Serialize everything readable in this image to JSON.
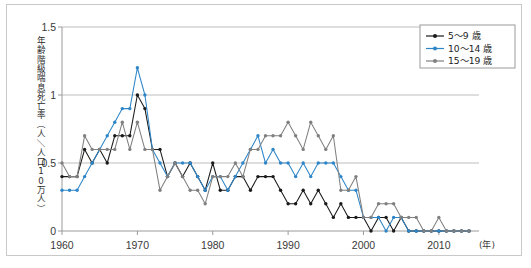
{
  "chart_data": {
    "type": "line",
    "title": "",
    "xlabel": "(年)",
    "ylabel": "年齢階級喘息死亡率（人／人口10万人）",
    "ylim": [
      0,
      1.5
    ],
    "xlim": [
      1960,
      2014
    ],
    "yticks": [
      "0",
      "0.5",
      "1",
      "1.5"
    ],
    "ytick_values": [
      0,
      0.5,
      1,
      1.5
    ],
    "xticks": [
      "1960",
      "1970",
      "1980",
      "1990",
      "2000",
      "2010"
    ],
    "xtick_values": [
      1960,
      1970,
      1980,
      1990,
      2000,
      2010
    ],
    "grid": "horizontal",
    "legend_position": "top-right",
    "x": [
      1960,
      1961,
      1962,
      1963,
      1964,
      1965,
      1966,
      1967,
      1968,
      1969,
      1970,
      1971,
      1972,
      1973,
      1974,
      1975,
      1976,
      1977,
      1978,
      1979,
      1980,
      1981,
      1982,
      1983,
      1984,
      1985,
      1986,
      1987,
      1988,
      1989,
      1990,
      1991,
      1992,
      1993,
      1994,
      1995,
      1996,
      1997,
      1998,
      1999,
      2000,
      2001,
      2002,
      2003,
      2004,
      2005,
      2006,
      2007,
      2008,
      2009,
      2010,
      2011,
      2012,
      2013,
      2014
    ],
    "series": [
      {
        "name": "5〜9 歳",
        "color": "#1a1a1a",
        "marker": "circle",
        "values": [
          0.4,
          0.4,
          0.4,
          0.6,
          0.5,
          0.6,
          0.5,
          0.7,
          0.7,
          0.7,
          1.0,
          0.9,
          0.6,
          0.6,
          0.4,
          0.5,
          0.4,
          0.5,
          0.4,
          0.3,
          0.5,
          0.3,
          0.3,
          0.4,
          0.4,
          0.3,
          0.4,
          0.4,
          0.4,
          0.3,
          0.2,
          0.2,
          0.3,
          0.2,
          0.3,
          0.2,
          0.1,
          0.2,
          0.1,
          0.1,
          0.1,
          0.0,
          0.1,
          0.1,
          0.0,
          0.1,
          0.0,
          0.0,
          0.0,
          0.0,
          0.0,
          0.0,
          0.0,
          0.0,
          0.0
        ]
      },
      {
        "name": "10〜14 歳",
        "color": "#2e86c8",
        "marker": "circle",
        "values": [
          0.3,
          0.3,
          0.3,
          0.4,
          0.5,
          0.6,
          0.7,
          0.8,
          0.9,
          0.9,
          1.2,
          1.0,
          0.6,
          0.5,
          0.4,
          0.5,
          0.5,
          0.5,
          0.4,
          0.3,
          0.4,
          0.4,
          0.3,
          0.4,
          0.5,
          0.6,
          0.7,
          0.5,
          0.6,
          0.5,
          0.5,
          0.4,
          0.5,
          0.4,
          0.5,
          0.5,
          0.5,
          0.4,
          0.3,
          0.3,
          0.1,
          0.1,
          0.1,
          0.0,
          0.1,
          0.1,
          0.0,
          0.0,
          0.0,
          0.0,
          0.0,
          0.0,
          0.0,
          0.0,
          0.0
        ]
      },
      {
        "name": "15〜19 歳",
        "color": "#808080",
        "marker": "circle",
        "values": [
          0.5,
          0.4,
          0.4,
          0.7,
          0.6,
          0.6,
          0.6,
          0.6,
          0.8,
          0.6,
          0.8,
          0.6,
          0.6,
          0.3,
          0.4,
          0.5,
          0.4,
          0.3,
          0.3,
          0.2,
          0.4,
          0.4,
          0.4,
          0.5,
          0.4,
          0.6,
          0.6,
          0.7,
          0.7,
          0.7,
          0.8,
          0.7,
          0.6,
          0.8,
          0.7,
          0.6,
          0.7,
          0.3,
          0.3,
          0.4,
          0.1,
          0.1,
          0.2,
          0.2,
          0.2,
          0.1,
          0.1,
          0.1,
          0.0,
          0.0,
          0.1,
          0.0,
          0.0,
          0.0,
          0.0
        ]
      }
    ]
  },
  "legend": {
    "items": [
      {
        "label": "5〜9 歳",
        "color": "#1a1a1a"
      },
      {
        "label": "10〜14 歳",
        "color": "#2e86c8"
      },
      {
        "label": "15〜19 歳",
        "color": "#808080"
      }
    ]
  },
  "axis": {
    "x_unit_label": "(年)",
    "y_axis_title": "年齢階級喘息死亡率（人／人口10万人）"
  }
}
